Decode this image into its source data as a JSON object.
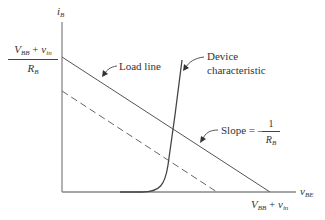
{
  "diagram": {
    "axes": {
      "y_label": {
        "main": "i",
        "sub": "B"
      },
      "x_label": {
        "main": "v",
        "sub": "BE"
      }
    },
    "y_intercept": {
      "numerator": {
        "v": "V",
        "v_sub": "BB",
        "plus": " + ",
        "vin": "v",
        "vin_sub": "in"
      },
      "denominator": {
        "r": "R",
        "r_sub": "B"
      }
    },
    "x_intercept": {
      "v": "V",
      "v_sub": "BB",
      "plus": " + ",
      "vin": "v",
      "vin_sub": "in"
    },
    "annotations": {
      "load_line": "Load line",
      "device_line1": "Device",
      "device_line2": "characteristic",
      "slope_prefix": "Slope = –",
      "slope_num": "1",
      "slope_den": "R",
      "slope_den_sub": "B"
    },
    "colors": {
      "line": "#555555",
      "axis": "#777777"
    }
  }
}
